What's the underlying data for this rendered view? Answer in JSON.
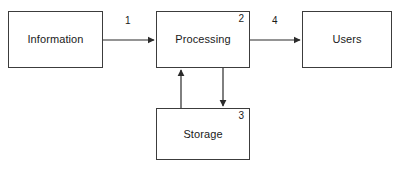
{
  "diagram": {
    "background_color": "#ffffff",
    "line_color": "#3c3c3c",
    "text_color": "#1a1a1a",
    "nodes": [
      {
        "id": "information",
        "label": "Information",
        "number": ""
      },
      {
        "id": "processing",
        "label": "Processing",
        "number": "2"
      },
      {
        "id": "users",
        "label": "Users",
        "number": ""
      },
      {
        "id": "storage",
        "label": "Storage",
        "number": "3"
      }
    ],
    "edges": [
      {
        "id": "edge-1",
        "label": "1",
        "from": "information",
        "to": "processing",
        "direction": "right"
      },
      {
        "id": "edge-4",
        "label": "4",
        "from": "processing",
        "to": "users",
        "direction": "right"
      },
      {
        "id": "edge-up",
        "label": "",
        "from": "storage",
        "to": "processing",
        "direction": "up"
      },
      {
        "id": "edge-down",
        "label": "",
        "from": "processing",
        "to": "storage",
        "direction": "down"
      }
    ]
  }
}
